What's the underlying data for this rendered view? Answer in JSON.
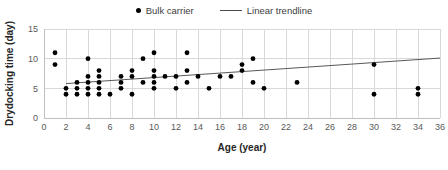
{
  "legend": {
    "position": "top-center",
    "entries": [
      {
        "label": "Bulk carrier",
        "marker": "dot-marker-icon",
        "color": "#000000"
      },
      {
        "label": "Linear trendline",
        "marker": "line-marker-icon",
        "color": "#4a4a4a"
      }
    ]
  },
  "chart_data": {
    "type": "scatter",
    "title": "",
    "xlabel": "Age (year)",
    "ylabel": "Drydocking time (day)",
    "xlim": [
      0,
      36
    ],
    "ylim": [
      0,
      15
    ],
    "xticks": [
      0,
      2,
      4,
      6,
      8,
      10,
      12,
      14,
      16,
      18,
      20,
      22,
      24,
      26,
      28,
      30,
      32,
      34,
      36
    ],
    "yticks": [
      0,
      5,
      10,
      15
    ],
    "grid": true,
    "series": [
      {
        "name": "Bulk carrier",
        "type": "scatter",
        "color": "#000000",
        "marker": "circle",
        "points": [
          [
            1,
            11
          ],
          [
            1,
            9
          ],
          [
            2,
            5
          ],
          [
            2,
            4
          ],
          [
            3,
            6
          ],
          [
            3,
            5
          ],
          [
            3,
            4
          ],
          [
            4,
            10
          ],
          [
            4,
            7
          ],
          [
            4,
            6
          ],
          [
            4,
            5
          ],
          [
            4,
            4
          ],
          [
            5,
            8
          ],
          [
            5,
            7
          ],
          [
            5,
            6
          ],
          [
            5,
            5
          ],
          [
            5,
            4
          ],
          [
            6,
            4
          ],
          [
            7,
            7
          ],
          [
            7,
            6
          ],
          [
            7,
            5
          ],
          [
            8,
            8
          ],
          [
            8,
            7
          ],
          [
            8,
            4
          ],
          [
            9,
            10
          ],
          [
            9,
            6
          ],
          [
            10,
            11
          ],
          [
            10,
            8
          ],
          [
            10,
            7
          ],
          [
            10,
            6
          ],
          [
            10,
            5
          ],
          [
            11,
            7
          ],
          [
            12,
            7
          ],
          [
            12,
            5
          ],
          [
            13,
            11
          ],
          [
            13,
            8
          ],
          [
            13,
            6
          ],
          [
            14,
            7
          ],
          [
            15,
            5
          ],
          [
            16,
            7
          ],
          [
            17,
            7
          ],
          [
            18,
            9
          ],
          [
            18,
            8
          ],
          [
            19,
            10
          ],
          [
            19,
            6
          ],
          [
            20,
            5
          ],
          [
            23,
            6
          ],
          [
            30,
            9
          ],
          [
            30,
            4
          ],
          [
            34,
            5
          ],
          [
            34,
            4
          ]
        ]
      },
      {
        "name": "Linear trendline",
        "type": "line",
        "color": "#595959",
        "points": [
          [
            2,
            5.8
          ],
          [
            36,
            10.1
          ]
        ]
      }
    ]
  }
}
